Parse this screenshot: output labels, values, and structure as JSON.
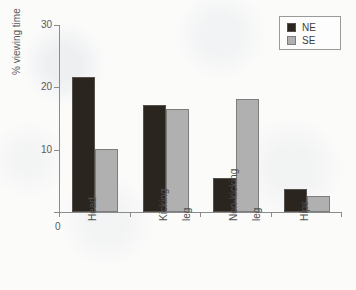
{
  "chart_data": {
    "type": "bar",
    "title": "",
    "xlabel": "",
    "ylabel": "% viewing time",
    "categories": [
      "Head",
      "Kicking leg",
      "Non-kicking leg",
      "Hips"
    ],
    "category_lines": [
      [
        "Head"
      ],
      [
        "Kicking",
        "leg"
      ],
      [
        "Non-kicking",
        "leg"
      ],
      [
        "Hips"
      ]
    ],
    "series": [
      {
        "name": "NE",
        "color": "#2b2520",
        "values": [
          21.7,
          17.2,
          5.5,
          3.7
        ]
      },
      {
        "name": "SE",
        "color": "#b0b0b0",
        "values": [
          10.1,
          16.5,
          18.2,
          2.5
        ]
      }
    ],
    "ylim": [
      0,
      30
    ],
    "yticks": [
      0,
      10,
      20,
      30
    ],
    "ytick_labels": [
      "0",
      "10",
      "20",
      "30"
    ],
    "grid": false,
    "legend_position": "top-right",
    "origin_label": "0"
  },
  "legend": {
    "entries": [
      {
        "label": "NE",
        "color": "#2b2520"
      },
      {
        "label": "SE",
        "color": "#b0b0b0"
      }
    ]
  },
  "caption": {
    "text": ""
  }
}
